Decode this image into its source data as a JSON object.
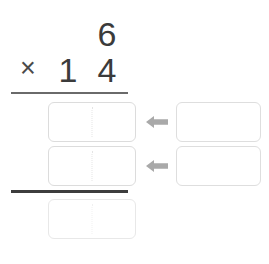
{
  "problem": {
    "carry_digit": "6",
    "operator": "×",
    "multiplier_tens": "1",
    "multiplier_ones": "4"
  },
  "answer_boxes": {
    "partial_product_1": "",
    "partial_product_2": "",
    "total": ""
  },
  "work_boxes": {
    "work_1": "",
    "work_2": ""
  },
  "arrows": {
    "arrow_1_icon": "arrow-left-icon",
    "arrow_2_icon": "arrow-left-icon"
  },
  "colors": {
    "digit": "#3b3b3b",
    "box_border": "#dcdcdc",
    "divider": "#e4e4e4",
    "arrow": "#a9a9a9",
    "rule_top": "#6a6a6a",
    "rule_bottom": "#3d3d3d",
    "background": "#ffffff"
  }
}
